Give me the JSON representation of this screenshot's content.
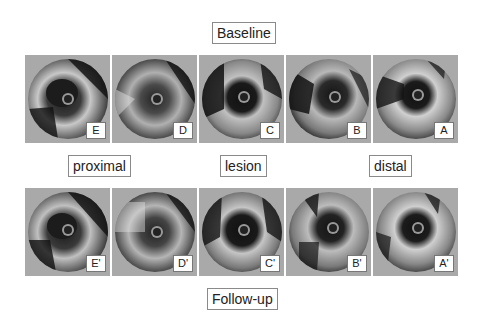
{
  "figure": {
    "title_top": "Baseline",
    "title_bottom": "Follow-up",
    "region_labels": {
      "proximal": "proximal",
      "lesion": "lesion",
      "distal": "distal"
    },
    "baseline_panels": [
      {
        "id": "E",
        "label": "E"
      },
      {
        "id": "D",
        "label": "D"
      },
      {
        "id": "C",
        "label": "C"
      },
      {
        "id": "B",
        "label": "B"
      },
      {
        "id": "A",
        "label": "A"
      }
    ],
    "followup_panels": [
      {
        "id": "E_prime",
        "label": "E'"
      },
      {
        "id": "D_prime",
        "label": "D'"
      },
      {
        "id": "C_prime",
        "label": "C'"
      },
      {
        "id": "B_prime",
        "label": "B'"
      },
      {
        "id": "A_prime",
        "label": "A'"
      }
    ],
    "colors": {
      "panel_background": "#a9a9a9",
      "label_border": "#8a8a8a"
    }
  }
}
